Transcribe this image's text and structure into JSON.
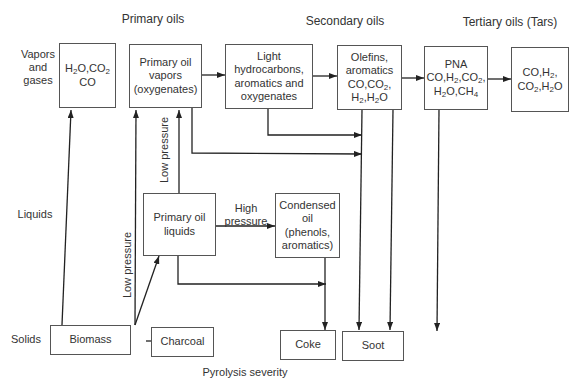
{
  "column_headers": {
    "primary": "Primary oils",
    "secondary": "Secondary oils",
    "tertiary": "Tertiary oils (Tars)"
  },
  "row_labels": {
    "vapors": "Vapors and gases",
    "vapors_lines": [
      "Vapors",
      "and",
      "gases"
    ],
    "liquids": "Liquids",
    "solids": "Solids"
  },
  "axis_label": "Pyrolysis severity",
  "edge_labels": {
    "low_pressure_1": "Low pressure",
    "low_pressure_2": "Low pressure",
    "high_pressure_lines": [
      "High",
      "pressure"
    ]
  },
  "boxes": {
    "gases_primary": {
      "lines": [
        "H2O,CO2",
        "CO"
      ]
    },
    "primary_vapors": {
      "lines": [
        "Primary oil",
        "vapors",
        "(oxygenates)"
      ]
    },
    "light_hc": {
      "lines": [
        "Light",
        "hydrocarbons,",
        "aromatics and",
        "oxygenates"
      ]
    },
    "olefins": {
      "lines": [
        "Olefins,",
        "aromatics",
        "CO,CO2,",
        "H2,H2O"
      ]
    },
    "pna": {
      "lines": [
        "PNA",
        "CO,H2,CO2,",
        "H2O,CH4"
      ]
    },
    "final_gases": {
      "lines": [
        "CO,H2,",
        "CO2,H2O"
      ]
    },
    "primary_liquids": {
      "lines": [
        "Primary oil",
        "liquids"
      ]
    },
    "condensed_oil": {
      "lines": [
        "Condensed",
        "oil",
        "(phenols,",
        "aromatics)"
      ]
    },
    "biomass": {
      "label": "Biomass"
    },
    "charcoal": {
      "label": "Charcoal"
    },
    "coke": {
      "label": "Coke"
    },
    "soot": {
      "label": "Soot"
    }
  },
  "colors": {
    "line": "#222222",
    "box_border": "#555555",
    "text": "#333333"
  }
}
